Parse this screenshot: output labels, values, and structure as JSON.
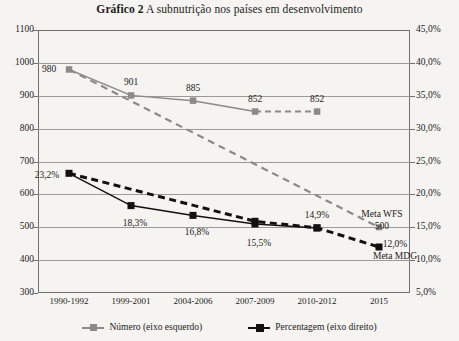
{
  "title": {
    "bold_prefix": "Gráfico 2",
    "rest": " A subnutrição nos países em desenvolvimento"
  },
  "colors": {
    "numero_series": "#8a8a8a",
    "percentagem_series": "#111111",
    "axis": "#6e6e6e",
    "gridline": "#9a9a9a",
    "background": "#f6f4f1"
  },
  "legend": {
    "items": [
      {
        "label": "Número (eixo esquerdo)",
        "color": "#8a8a8a"
      },
      {
        "label": "Percentagem (eixo direito)",
        "color": "#111111"
      }
    ]
  },
  "annotations": [
    {
      "id": "meta-wfs",
      "line1": "Meta WFS",
      "line2": "500"
    },
    {
      "id": "meta-mdg",
      "line1": "12,0%",
      "line2": "Meta MDG"
    }
  ],
  "chart_data": {
    "type": "line",
    "title": "Gráfico 2 A subnutrição nos países em desenvolvimento",
    "xlabel": "",
    "ylabel": "",
    "categories": [
      "1990-1992",
      "1999-2001",
      "2004-2006",
      "2007-2009",
      "2010-2012",
      "2015"
    ],
    "left_axis": {
      "label": "Número (eixo esquerdo)",
      "ylim": [
        300,
        1100
      ],
      "ticks": [
        300,
        400,
        500,
        600,
        700,
        800,
        900,
        1000,
        1100
      ],
      "ticklabels": [
        "300",
        "400",
        "500",
        "600",
        "700",
        "800",
        "900",
        "1000",
        "1100"
      ]
    },
    "right_axis": {
      "label": "Percentagem (eixo direito)",
      "ylim": [
        5,
        45
      ],
      "ticks": [
        5,
        10,
        15,
        20,
        25,
        30,
        35,
        40,
        45
      ],
      "ticklabels": [
        "5,0%",
        "10,0%",
        "15,0%",
        "20,0%",
        "25,0%",
        "30,0%",
        "35,0%",
        "40,0%",
        "45,0%"
      ]
    },
    "grid": true,
    "legend_position": "bottom",
    "series": [
      {
        "name": "Número (eixo esquerdo)",
        "axis": "left",
        "style": "solid",
        "color": "#8a8a8a",
        "marker": "square",
        "values": [
          980,
          901,
          885,
          852,
          852,
          null
        ],
        "datalabels": [
          "980",
          "901",
          "885",
          "852",
          "852",
          ""
        ]
      },
      {
        "name": "Número — segmento tracejado",
        "axis": "left",
        "style": "dashed",
        "color": "#8a8a8a",
        "marker": "square",
        "x": [
          "2007-2009",
          "2010-2012"
        ],
        "values": [
          852,
          852
        ]
      },
      {
        "name": "Meta WFS (trajetória)",
        "axis": "left",
        "style": "dashed",
        "color": "#8a8a8a",
        "marker": "square",
        "x": [
          "1990-1992",
          "2015"
        ],
        "values": [
          980,
          500
        ],
        "endpoint_label": "Meta WFS 500"
      },
      {
        "name": "Percentagem (eixo direito)",
        "axis": "right",
        "style": "solid",
        "color": "#111111",
        "marker": "square",
        "values": [
          23.2,
          18.3,
          16.8,
          15.5,
          14.9,
          null
        ],
        "datalabels": [
          "23,2%",
          "18,3%",
          "16,8%",
          "15,5%",
          "14,9%",
          ""
        ]
      },
      {
        "name": "Meta MDG (trajetória)",
        "axis": "right",
        "style": "dashed",
        "color": "#111111",
        "marker": "square",
        "x": [
          "1990-1992",
          "2007-2009",
          "2010-2012",
          "2015"
        ],
        "values": [
          23.2,
          15.9,
          14.9,
          12.0
        ],
        "endpoint_label": "12,0% Meta MDG"
      }
    ]
  }
}
